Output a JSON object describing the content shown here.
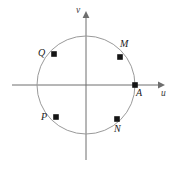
{
  "figure": {
    "kind": "unit-circle-diagram",
    "background_color": "#ffffff",
    "axis_color": "#6e6e6e",
    "circle_color": "#9a9a9a",
    "point_color": "#151515",
    "axes": {
      "horizontal": {
        "label": "u",
        "label_x": 162,
        "label_y": 92,
        "x1": 12,
        "y1": 85,
        "x2": 163,
        "y2": 85
      },
      "vertical": {
        "label": "v",
        "label_x": 76,
        "label_y": 8,
        "x1": 86,
        "y1": 160,
        "x2": 86,
        "y2": 13
      }
    },
    "circle": {
      "cx": 86,
      "cy": 85,
      "r": 49
    },
    "points": [
      {
        "label": "M",
        "x": 120,
        "y": 57,
        "label_x": 121,
        "label_y": 41,
        "label_align": "above"
      },
      {
        "label": "Q",
        "x": 54,
        "y": 54,
        "label_x": 38,
        "label_y": 49,
        "label_align": "left"
      },
      {
        "label": "A",
        "x": 135,
        "y": 85,
        "label_x": 136,
        "label_y": 88,
        "label_align": "below-right"
      },
      {
        "label": "P",
        "x": 56,
        "y": 117,
        "label_x": 41,
        "label_y": 114,
        "label_align": "left"
      },
      {
        "label": "N",
        "x": 117,
        "y": 119,
        "label_x": 114,
        "label_y": 124,
        "label_align": "below"
      }
    ]
  }
}
